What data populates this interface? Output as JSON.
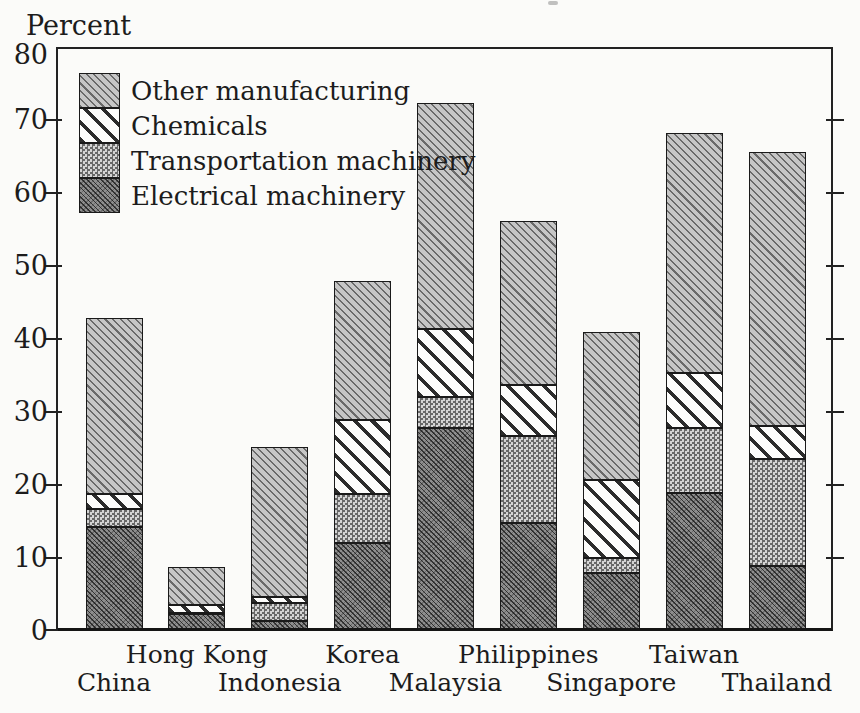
{
  "figure": {
    "background": "#fbfbf9",
    "ink": "#1c1c1c"
  },
  "chart_data": {
    "type": "bar",
    "stacked": true,
    "title": "",
    "ylabel": "Percent",
    "xlabel": "",
    "ylim": [
      0,
      80
    ],
    "yticks": [
      0,
      10,
      20,
      30,
      40,
      50,
      60,
      70,
      80
    ],
    "grid": false,
    "legend_position": "upper-left-inside",
    "categories": [
      "China",
      "Hong Kong",
      "Indonesia",
      "Korea",
      "Malaysia",
      "Philippines",
      "Singapore",
      "Taiwan",
      "Thailand"
    ],
    "series": [
      {
        "name": "Electrical machinery",
        "pattern": "electrical",
        "values": [
          14.3,
          2.3,
          1.4,
          12.0,
          27.8,
          14.8,
          8.0,
          18.9,
          8.9
        ]
      },
      {
        "name": "Transportation machinery",
        "pattern": "transportation",
        "values": [
          2.4,
          0.2,
          2.4,
          6.8,
          4.2,
          11.9,
          2.0,
          8.9,
          14.6
        ]
      },
      {
        "name": "Chemicals",
        "pattern": "chemicals",
        "values": [
          2.0,
          1.0,
          0.9,
          10.1,
          9.4,
          7.0,
          10.7,
          7.5,
          4.6
        ]
      },
      {
        "name": "Other manufacturing",
        "pattern": "other",
        "values": [
          24.2,
          5.3,
          20.5,
          19.0,
          30.9,
          22.4,
          20.3,
          32.9,
          37.5
        ]
      }
    ],
    "totals": [
      42.9,
      8.8,
      25.2,
      47.9,
      72.3,
      56.1,
      41.0,
      68.2,
      65.6
    ],
    "legend": [
      {
        "label": "Other manufacturing",
        "pattern": "other"
      },
      {
        "label": "Chemicals",
        "pattern": "chemicals"
      },
      {
        "label": "Transportation machinery",
        "pattern": "transportation"
      },
      {
        "label": "Electrical machinery",
        "pattern": "electrical"
      }
    ],
    "patterns": {
      "electrical": {
        "style": "dense diagonal weave",
        "base": "#8e8e8e",
        "line": "#1f1f1f"
      },
      "transportation": {
        "style": "checkerboard",
        "dark": "#686868",
        "light": "#d4d4d4"
      },
      "chemicals": {
        "style": "wide diagonal stripes",
        "base": "#fcfcfb",
        "line": "#2c2c2c"
      },
      "other": {
        "style": "fine diagonal hatch",
        "base": "#c6c6c6",
        "line": "#3a3a3a"
      }
    }
  }
}
